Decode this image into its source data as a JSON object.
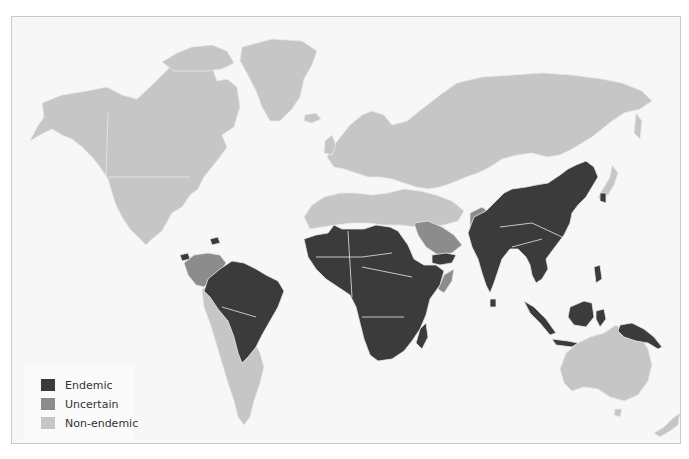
{
  "map": {
    "type": "choropleth-world",
    "colors": {
      "ocean": "#f7f7f7",
      "endemic": "#3b3b3b",
      "uncertain": "#8c8c8c",
      "non_endemic": "#c6c6c6",
      "border": "#e8e8e8",
      "frame": "#c9c9c9"
    },
    "regions": {
      "endemic": [
        "Sub-Saharan Africa",
        "Brazil",
        "Venezuela (east)/Guianas",
        "Costa Rica",
        "Haiti",
        "China",
        "India",
        "Southeast Asia",
        "Indonesia",
        "Papua New Guinea",
        "Yemen"
      ],
      "uncertain": [
        "Colombia",
        "Venezuela (west)",
        "Saudi Arabia",
        "Pakistan",
        "Somalia"
      ],
      "non_endemic": [
        "North America",
        "Greenland",
        "Europe",
        "Russia",
        "Central Asia",
        "Middle East",
        "North Africa",
        "Southern South America",
        "Australia",
        "New Zealand",
        "Japan",
        "Mongolia"
      ]
    }
  },
  "legend": {
    "items": [
      {
        "label": "Endemic",
        "color": "#3b3b3b"
      },
      {
        "label": "Uncertain",
        "color": "#8c8c8c"
      },
      {
        "label": "Non-endemic",
        "color": "#c6c6c6"
      }
    ]
  }
}
